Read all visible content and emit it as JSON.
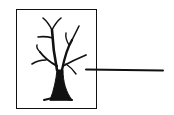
{
  "diagram": {
    "frame": {
      "label": ""
    },
    "figure": {
      "icon": "bare-tree-icon"
    },
    "pointer_line": {
      "label": ""
    },
    "colors": {
      "ink": "#111111",
      "background": "#ffffff"
    }
  }
}
